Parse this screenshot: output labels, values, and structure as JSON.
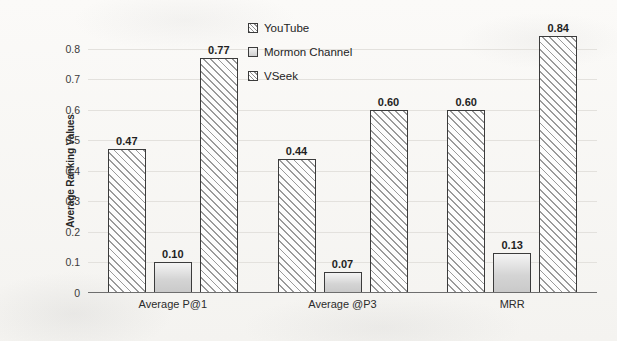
{
  "chart_data": {
    "type": "bar",
    "title": "",
    "xlabel": "",
    "ylabel": "Average Ranking Values",
    "ylim": [
      0,
      0.9
    ],
    "grid": true,
    "legend_position": "top-center",
    "categories": [
      "Average P@1",
      "Average @P3",
      "MRR"
    ],
    "ytick_labels": [
      "0",
      "0.1",
      "0.2",
      "0.3",
      "0.4",
      "0.5",
      "0.6",
      "0.7",
      "0.8"
    ],
    "ytick_values": [
      0,
      0.1,
      0.2,
      0.3,
      0.4,
      0.5,
      0.6,
      0.7,
      0.8
    ],
    "series": [
      {
        "name": "YouTube",
        "fill": "hatch",
        "values": [
          0.47,
          0.44,
          0.6
        ],
        "labels": [
          "0.47",
          "0.44",
          "0.60"
        ]
      },
      {
        "name": "Mormon Channel",
        "fill": "solid",
        "values": [
          0.1,
          0.07,
          0.13
        ],
        "labels": [
          "0.10",
          "0.07",
          "0.13"
        ]
      },
      {
        "name": "VSeek",
        "fill": "hatch",
        "values": [
          0.77,
          0.6,
          0.84
        ],
        "labels": [
          "0.77",
          "0.60",
          "0.84"
        ]
      }
    ]
  },
  "colors": {
    "background": "#f7f6f4",
    "bar_outline": "#3b3b3b",
    "hatch": "#9a9a9a",
    "gridline": "#e3e1dd",
    "axis": "#6e6e6e",
    "text": "#2a2a2a"
  }
}
